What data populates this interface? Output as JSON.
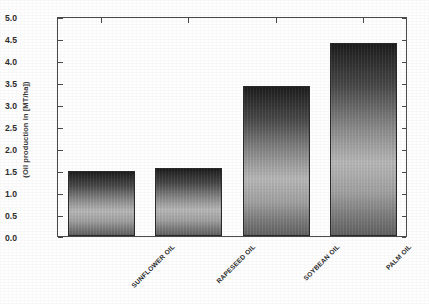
{
  "chart_data": {
    "type": "bar",
    "title": "",
    "xlabel": "",
    "ylabel": "(Oil production in [MT/ha])",
    "categories": [
      "SUNFLOWER OIL",
      "RAPESEED OIL",
      "SOYBEAN OIL",
      "PALM OIL"
    ],
    "values": [
      1.48,
      1.55,
      3.45,
      4.43
    ],
    "ylim": [
      0.0,
      5.0
    ],
    "ytick_labels": [
      "0.0",
      "0.5",
      "1.0",
      "1.5",
      "2.0",
      "2.5",
      "3.0",
      "3.5",
      "4.0",
      "4.5",
      "5.0"
    ],
    "ytick_values": [
      0.0,
      0.5,
      1.0,
      1.5,
      2.0,
      2.5,
      3.0,
      3.5,
      4.0,
      4.5,
      5.0
    ],
    "grid": false,
    "legend": null,
    "bar_color_top": "#1c1c1c",
    "bar_color_mid": "#b9b9b9",
    "bar_color_bottom": "#636363",
    "axis_color": "#4a4a4a",
    "xtick_label_rotation": -45
  },
  "axis": {
    "y_title": "(Oil production in [MT/ha])"
  },
  "ticks": {
    "t0": "0.0",
    "t1": "0.5",
    "t2": "1.0",
    "t3": "1.5",
    "t4": "2.0",
    "t5": "2.5",
    "t6": "3.0",
    "t7": "3.5",
    "t8": "4.0",
    "t9": "4.5",
    "t10": "5.0"
  },
  "bars": {
    "b0": "SUNFLOWER OIL",
    "b1": "RAPESEED OIL",
    "b2": "SOYBEAN OIL",
    "b3": "PALM OIL"
  }
}
